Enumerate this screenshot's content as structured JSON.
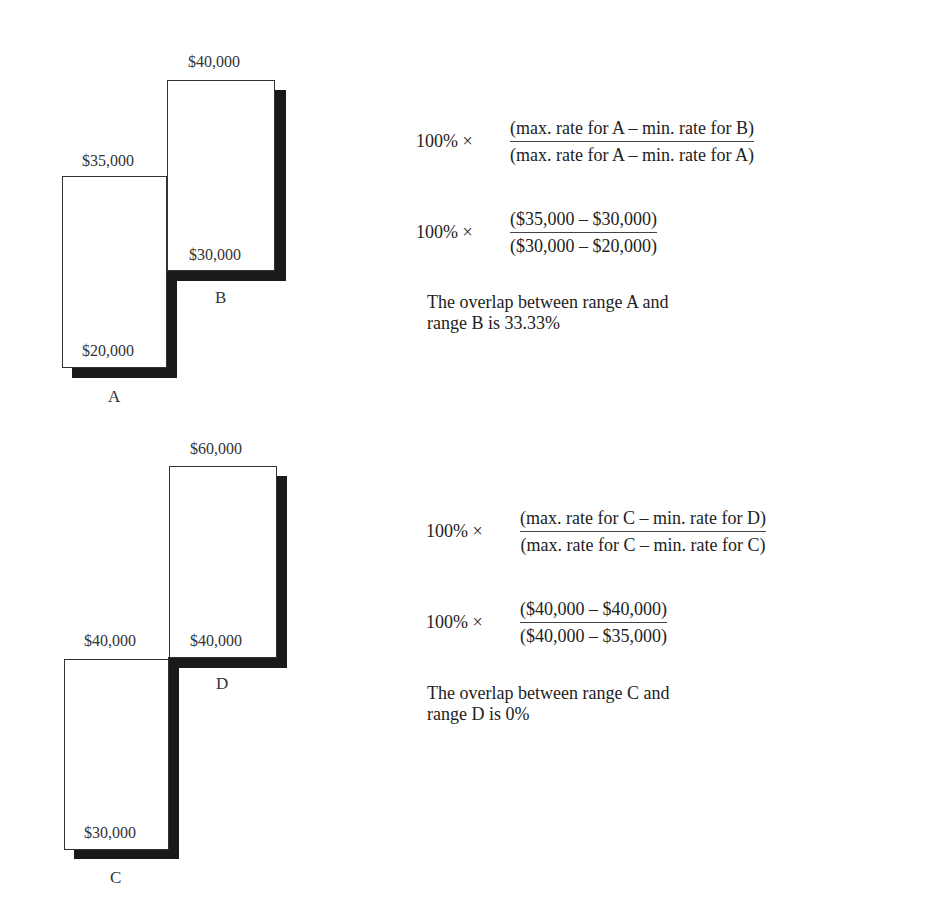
{
  "diagram_top": {
    "range_a": {
      "name": "A",
      "max_label": "$35,000",
      "min_label": "$20,000"
    },
    "range_b": {
      "name": "B",
      "max_label": "$40,000",
      "min_label": "$30,000"
    },
    "formula_general": {
      "multiplier": "100% ×",
      "numerator": "(max. rate for A  –  min. rate for B)",
      "denominator": "(max. rate for A  –  min. rate for A)"
    },
    "formula_values": {
      "multiplier": "100% ×",
      "numerator": "($35,000  –  $30,000)",
      "denominator": "($30,000  –  $20,000)"
    },
    "conclusion": "The overlap between range A and range B is 33.33%"
  },
  "diagram_bottom": {
    "range_c": {
      "name": "C",
      "max_label": "$40,000",
      "min_label": "$30,000"
    },
    "range_d": {
      "name": "D",
      "max_label": "$60,000",
      "min_label": "$40,000"
    },
    "formula_general": {
      "multiplier": "100% ×",
      "numerator": "(max. rate for C  –  min. rate for D)",
      "denominator": "(max. rate for C  –  min. rate for C)"
    },
    "formula_values": {
      "multiplier": "100% ×",
      "numerator": "($40,000  –  $40,000)",
      "denominator": "($40,000  –  $35,000)",
      "denominator_note": "Transcribed as printed. Per the general formula and box C's labels, this should read ($40,000 – $30,000); $35,000 appears to be a typo carried over from range A. The result is unaffected because the numerator is 0."
    },
    "conclusion": "The overlap between range C and range D is 0%"
  }
}
